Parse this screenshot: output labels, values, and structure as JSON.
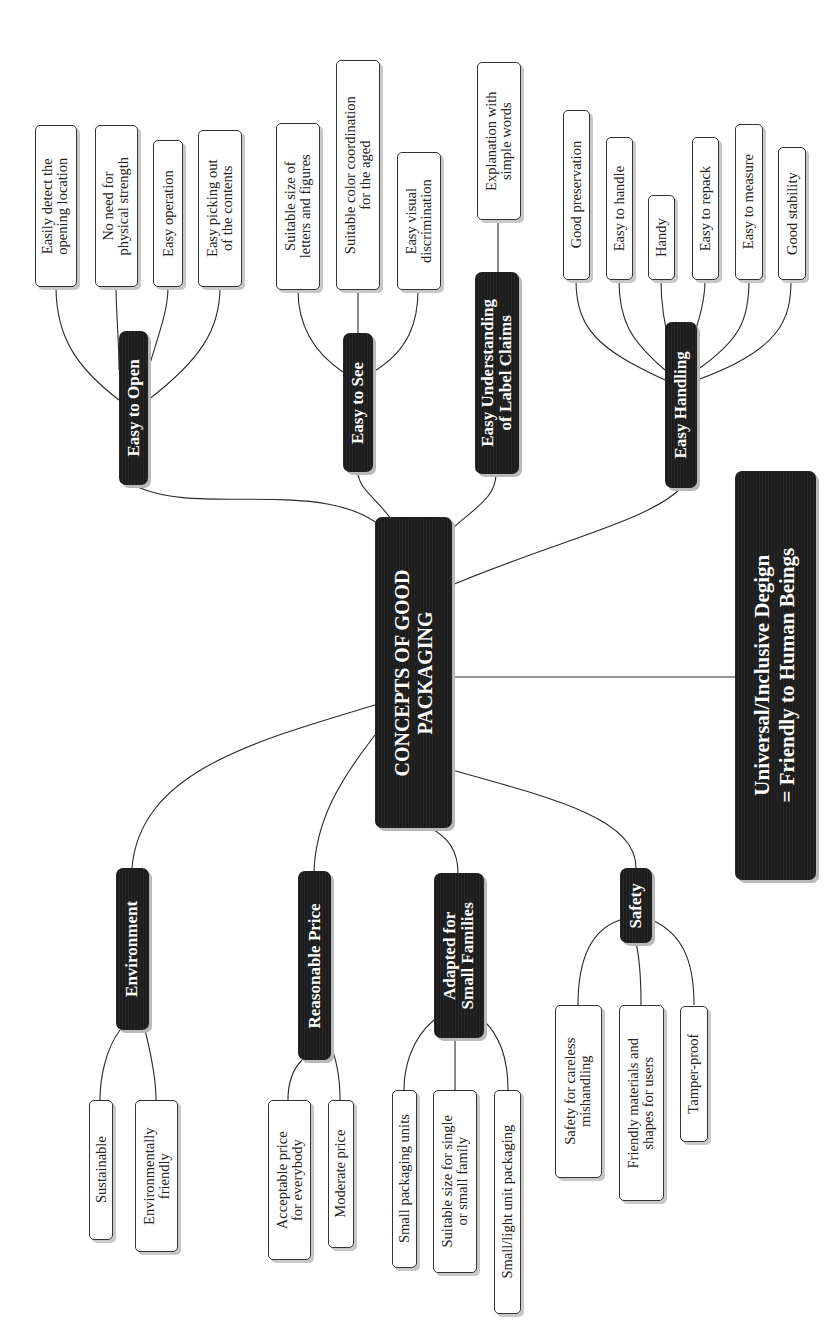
{
  "diagram": {
    "center": {
      "label": "CONCEPTS OF GOOD\nPACKAGING"
    },
    "summary": {
      "label": "Universal/Inclusive Degign\n= Friendly to Human Beings"
    },
    "branches": [
      {
        "id": "easy-to-open",
        "label": "Easy to Open",
        "children": [
          "Easily detect the\nopening location",
          "No need for\nphysical strength",
          "Easy operation",
          "Easy picking out\nof the contents"
        ]
      },
      {
        "id": "easy-to-see",
        "label": "Easy to See",
        "children": [
          "Suitable size of\nletters and figures",
          "Suitable color coordination\nfor the aged",
          "Easy visual\ndiscrimination"
        ]
      },
      {
        "id": "easy-understanding",
        "label": "Easy Understanding\nof Label Claims",
        "children": [
          "Explanation with\nsimple words"
        ]
      },
      {
        "id": "easy-handling",
        "label": "Easy Handling",
        "children": [
          "Good preservation",
          "Easy to handle",
          "Handy",
          "Easy to repack",
          "Easy to measure",
          "Good stability"
        ]
      },
      {
        "id": "environment",
        "label": "Environment",
        "children": [
          "Sustainable",
          "Environmentally\nfriendly"
        ]
      },
      {
        "id": "reasonable-price",
        "label": "Reasonable Price",
        "children": [
          "Acceptable price\nfor everybody",
          "Moderate price"
        ]
      },
      {
        "id": "small-families",
        "label": "Adapted for\nSmall Families",
        "children": [
          "Small packaging units",
          "Suitable size for single\nor small family",
          "Small/light unit packaging"
        ]
      },
      {
        "id": "safety",
        "label": "Safety",
        "children": [
          "Safety for careless\nmishandling",
          "Friendly materials and\nshapes for users",
          "Tamper-proof"
        ]
      }
    ]
  },
  "colors": {
    "node_dark": "#1c1c1c",
    "node_text": "#ffffff",
    "leaf_border": "#333333",
    "connector": "#2a2a2a"
  }
}
